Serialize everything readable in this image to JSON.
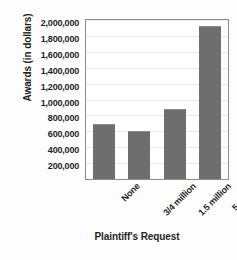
{
  "chart_data": {
    "type": "bar",
    "title": "",
    "xlabel": "Plaintiff's Request",
    "ylabel": "Awards (in dollars)",
    "categories": [
      "None",
      "3/4 million",
      "1.5 million",
      "5 million"
    ],
    "values": [
      690000,
      600000,
      880000,
      1925000
    ],
    "series": [
      {
        "name": "Awards",
        "values": [
          690000,
          600000,
          880000,
          1925000
        ]
      }
    ],
    "ylim": [
      0,
      2000000
    ],
    "ytick_values": [
      200000,
      400000,
      600000,
      800000,
      1000000,
      1200000,
      1400000,
      1600000,
      1800000,
      2000000
    ],
    "ytick_labels": [
      "200,000",
      "400,000",
      "600,000",
      "800,000",
      "1,000,000",
      "1,200,000",
      "1,400,000",
      "1,600,000",
      "1,800,000",
      "2,000,000"
    ],
    "grid": true,
    "legend": false,
    "legend_position": "none",
    "bar_color": "#6e6e6e",
    "plot_border_color": "#8d8d8d",
    "gridline_color": "#e9e9e9",
    "background_color": "#ffffff"
  }
}
